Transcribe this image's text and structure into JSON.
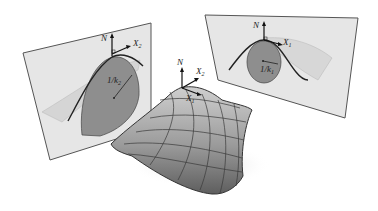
{
  "figure": {
    "center_surface": {
      "normal_label": "N",
      "direction_1_label": "X",
      "direction_1_sub": "1",
      "direction_2_label": "X",
      "direction_2_sub": "2"
    },
    "left_plane": {
      "normal_label": "N",
      "direction_label": "X",
      "direction_sub": "2",
      "radius_label": "1/k",
      "radius_sub": "2"
    },
    "right_plane": {
      "normal_label": "N",
      "direction_label": "X",
      "direction_sub": "1",
      "radius_label": "1/k",
      "radius_sub": "1"
    },
    "colors": {
      "plane_fill": "#e4e4e4",
      "plane_edge": "#555555",
      "circle_fill": "#8c8c8c",
      "surface_light": "#c8c8c8",
      "surface_dark": "#6a6a6a",
      "curve": "#222222"
    }
  }
}
